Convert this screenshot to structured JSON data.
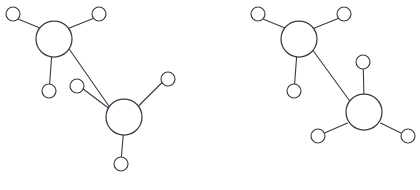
{
  "figure": {
    "background_color": "#ffffff",
    "stroke_color": "#3a3a42",
    "fill_color": "#ffffff",
    "width": 420,
    "height": 190,
    "panels": [
      {
        "id": "left-panel",
        "name": "left-structure",
        "caption": "",
        "molecules": [
          {
            "id": "left-mol-1",
            "name": "upper-left-molecule",
            "center_atom": {
              "label": "",
              "cx": 54,
              "cy": 39,
              "r": 18
            },
            "substituents": [
              {
                "label": "",
                "cx": 13,
                "cy": 14,
                "r": 7
              },
              {
                "label": "",
                "cx": 99,
                "cy": 14,
                "r": 7
              },
              {
                "label": "",
                "cx": 49,
                "cy": 91,
                "r": 7
              }
            ]
          },
          {
            "id": "left-mol-2",
            "name": "lower-right-molecule",
            "center_atom": {
              "label": "",
              "cx": 124,
              "cy": 117,
              "r": 18
            },
            "substituents": [
              {
                "label": "",
                "cx": 77,
                "cy": 86,
                "r": 7
              },
              {
                "label": "",
                "cx": 168,
                "cy": 79,
                "r": 7
              },
              {
                "label": "",
                "cx": 121,
                "cy": 164,
                "r": 7
              }
            ]
          }
        ],
        "inter_bond": {
          "from": "left-mol-1",
          "to": "left-mol-2"
        }
      },
      {
        "id": "right-panel",
        "name": "right-structure",
        "caption": "",
        "molecules": [
          {
            "id": "right-mol-1",
            "name": "upper-left-molecule",
            "center_atom": {
              "label": "",
              "cx": 299,
              "cy": 39,
              "r": 18
            },
            "substituents": [
              {
                "label": "",
                "cx": 258,
                "cy": 14,
                "r": 7
              },
              {
                "label": "",
                "cx": 344,
                "cy": 14,
                "r": 7
              },
              {
                "label": "",
                "cx": 294,
                "cy": 91,
                "r": 7
              }
            ]
          },
          {
            "id": "right-mol-2",
            "name": "lower-right-molecule",
            "center_atom": {
              "label": "",
              "cx": 364,
              "cy": 112,
              "r": 18
            },
            "substituents": [
              {
                "label": "",
                "cx": 363,
                "cy": 62,
                "r": 7
              },
              {
                "label": "",
                "cx": 318,
                "cy": 136,
                "r": 7
              },
              {
                "label": "",
                "cx": 408,
                "cy": 136,
                "r": 7
              }
            ]
          }
        ],
        "inter_bond": {
          "from": "right-mol-1",
          "to": "right-mol-2"
        }
      }
    ],
    "caption_fragments": [
      {
        "text": "",
        "x": 86,
        "y": 181
      },
      {
        "text": "",
        "x": 332,
        "y": 179
      }
    ]
  }
}
